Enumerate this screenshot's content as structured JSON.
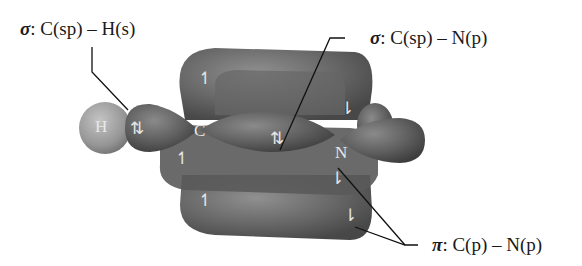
{
  "labels": {
    "sigma_ch": {
      "symbol": "σ",
      "text": ": C(sp) – H(s)"
    },
    "sigma_cn": {
      "symbol": "σ",
      "text": ": C(sp) – N(p)"
    },
    "pi_cn": {
      "symbol": "π",
      "text": ": C(p) – N(p)"
    }
  },
  "atoms": {
    "h": "H",
    "c": "C",
    "n": "N"
  },
  "spins": {
    "pair": "⇅",
    "pair2": "⇅",
    "up": "↿",
    "down": "⇂"
  },
  "colors": {
    "lobe": "#5c5c5c",
    "lobe_light": "#8a8a8a",
    "hydrogen": "#9a9a9a",
    "leader": "#111111"
  }
}
